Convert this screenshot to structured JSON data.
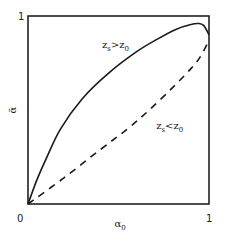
{
  "chart_data": {
    "type": "line",
    "title": "",
    "xlabel": "α0",
    "xlabel_main": "α",
    "xlabel_sub": "0",
    "ylabel": "ᾱ",
    "xlim": [
      0,
      1
    ],
    "ylim": [
      0,
      1
    ],
    "grid": false,
    "xticks": [
      "0",
      "1"
    ],
    "yticks": [
      "1"
    ],
    "series": [
      {
        "name": "zs>z0",
        "label_main_1": "z",
        "label_sub_1": "s",
        "label_op": ">",
        "label_main_2": "z",
        "label_sub_2": "0",
        "style": "solid",
        "x": [
          0,
          0.05,
          0.1,
          0.18,
          0.3,
          0.45,
          0.6,
          0.72,
          0.82,
          0.9,
          0.94,
          0.97,
          1.0
        ],
        "y": [
          0,
          0.13,
          0.24,
          0.4,
          0.56,
          0.7,
          0.81,
          0.88,
          0.93,
          0.955,
          0.96,
          0.95,
          0.9
        ]
      },
      {
        "name": "zs<z0",
        "label_main_1": "z",
        "label_sub_1": "s",
        "label_op": "<",
        "label_main_2": "z",
        "label_sub_2": "0",
        "style": "dashed",
        "x": [
          0,
          0.2,
          0.4,
          0.55,
          0.67,
          0.8,
          0.9,
          0.95,
          1.0
        ],
        "y": [
          0,
          0.14,
          0.29,
          0.4,
          0.5,
          0.62,
          0.72,
          0.78,
          0.87
        ]
      }
    ],
    "annotations": [
      {
        "text": "zs>z0",
        "x": 0.42,
        "y": 0.84
      },
      {
        "text": "zs<z0",
        "x": 0.73,
        "y": 0.41
      }
    ]
  }
}
